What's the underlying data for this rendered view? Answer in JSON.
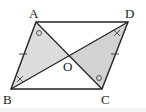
{
  "diagram": {
    "type": "parallelogram",
    "points": {
      "A": {
        "label": "A",
        "x": 36,
        "y": 22
      },
      "D": {
        "label": "D",
        "x": 128,
        "y": 22
      },
      "B": {
        "label": "B",
        "x": 11,
        "y": 89
      },
      "C": {
        "label": "C",
        "x": 102,
        "y": 89
      },
      "O": {
        "label": "O",
        "x": 69,
        "y": 56
      }
    },
    "shaded_triangles": [
      "ABO",
      "CDO"
    ],
    "markings": {
      "tick_sides": [
        "AB",
        "CD"
      ],
      "circle_angles": [
        "BAC",
        "DCA"
      ],
      "cross_angles": [
        "ABD",
        "CDB"
      ]
    },
    "colors": {
      "line": "#222222",
      "shade": "#d9d9d9",
      "mark": "#444444"
    }
  }
}
